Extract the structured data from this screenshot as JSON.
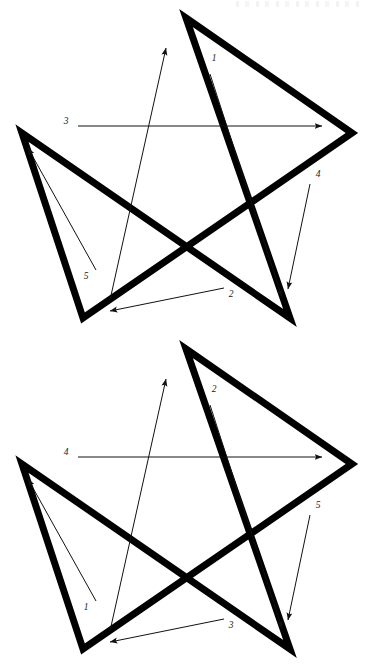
{
  "document": {
    "title": "Pentagram Stroke Order Diagrams",
    "type": "line-drawing",
    "background_color": "#ffffff",
    "ink_color": "#000000",
    "page_size": {
      "width": 370,
      "height": 666
    }
  },
  "figures": [
    {
      "id": "figure-1",
      "name": "pentagram-stroke-order-upper",
      "star": {
        "name": "pentagram",
        "stroke_color": "#000000",
        "stroke_width": 7,
        "points": [
          {
            "name": "apex",
            "x": 186,
            "y": 18
          },
          {
            "name": "right",
            "x": 352,
            "y": 133
          },
          {
            "name": "bottom-left",
            "x": 83,
            "y": 318
          },
          {
            "name": "left",
            "x": 22,
            "y": 133
          },
          {
            "name": "bottom-right",
            "x": 290,
            "y": 318
          }
        ]
      },
      "arrows": [
        {
          "label": "1",
          "name": "stroke-arrow-1",
          "label_x": 214,
          "label_y": 61,
          "from_x": 210,
          "from_y": 74,
          "to_x": 282,
          "to_y": 297,
          "direction": "apex-to-bottom-right"
        },
        {
          "label": "2",
          "name": "stroke-arrow-2",
          "label_x": 231,
          "label_y": 297,
          "from_x": 224,
          "from_y": 288,
          "to_x": 110,
          "to_y": 311,
          "direction": "bottom-right-to-bottom-left"
        },
        {
          "label": "3",
          "name": "stroke-arrow-3",
          "label_x": 66,
          "label_y": 124,
          "from_x": 78,
          "from_y": 126,
          "to_x": 322,
          "to_y": 126,
          "direction": "left-to-right"
        },
        {
          "label": "4",
          "name": "stroke-arrow-4",
          "label_x": 318,
          "label_y": 177,
          "from_x": 310,
          "from_y": 184,
          "to_x": 288,
          "to_y": 289,
          "direction": "right-to-bottom-right"
        },
        {
          "label": "5",
          "name": "stroke-arrow-5",
          "label_x": 86,
          "label_y": 279,
          "from_x": 96,
          "from_y": 270,
          "to_x": 28,
          "to_y": 148,
          "direction": "bottom-left-to-left"
        },
        {
          "label": "",
          "name": "stroke-arrow-apex-return",
          "label_x": 0,
          "label_y": 0,
          "from_x": 110,
          "from_y": 300,
          "to_x": 166,
          "to_y": 48,
          "direction": "bottom-left-to-apex"
        }
      ]
    },
    {
      "id": "figure-2",
      "name": "pentagram-stroke-order-lower",
      "star": {
        "name": "pentagram",
        "stroke_color": "#000000",
        "stroke_width": 7,
        "points": [
          {
            "name": "apex",
            "x": 186,
            "y": 18
          },
          {
            "name": "right",
            "x": 352,
            "y": 133
          },
          {
            "name": "bottom-left",
            "x": 83,
            "y": 318
          },
          {
            "name": "left",
            "x": 22,
            "y": 133
          },
          {
            "name": "bottom-right",
            "x": 290,
            "y": 318
          }
        ]
      },
      "arrows": [
        {
          "label": "2",
          "name": "stroke-arrow-2",
          "label_x": 214,
          "label_y": 61,
          "from_x": 210,
          "from_y": 74,
          "to_x": 282,
          "to_y": 297,
          "direction": "apex-to-bottom-right"
        },
        {
          "label": "3",
          "name": "stroke-arrow-3",
          "label_x": 231,
          "label_y": 297,
          "from_x": 224,
          "from_y": 288,
          "to_x": 110,
          "to_y": 311,
          "direction": "bottom-right-to-bottom-left"
        },
        {
          "label": "4",
          "name": "stroke-arrow-4",
          "label_x": 66,
          "label_y": 124,
          "from_x": 78,
          "from_y": 126,
          "to_x": 322,
          "to_y": 126,
          "direction": "left-to-right"
        },
        {
          "label": "5",
          "name": "stroke-arrow-5",
          "label_x": 318,
          "label_y": 177,
          "from_x": 310,
          "from_y": 184,
          "to_x": 288,
          "to_y": 289,
          "direction": "right-to-bottom-right"
        },
        {
          "label": "1",
          "name": "stroke-arrow-1",
          "label_x": 86,
          "label_y": 279,
          "from_x": 96,
          "from_y": 270,
          "to_x": 28,
          "to_y": 148,
          "direction": "bottom-left-to-left"
        },
        {
          "label": "",
          "name": "stroke-arrow-apex-return",
          "label_x": 0,
          "label_y": 0,
          "from_x": 110,
          "from_y": 300,
          "to_x": 166,
          "to_y": 48,
          "direction": "bottom-left-to-apex"
        }
      ]
    }
  ]
}
